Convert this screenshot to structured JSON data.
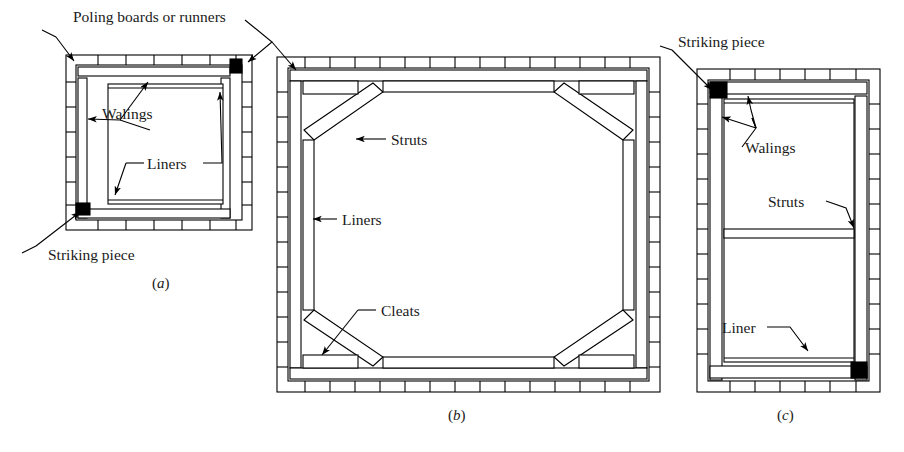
{
  "figure": {
    "background_color": "#ffffff",
    "line_color": "#000000",
    "fill_color": "#ffffff",
    "solid_member_color": "#000000"
  },
  "panels": [
    {
      "id": "a",
      "caption": "(a)",
      "caption_paren_open": "(",
      "caption_letter": "a",
      "caption_paren_close": ")",
      "description": "Square excavation with poling boards, walings and striking pieces",
      "labels": [
        {
          "name": "poling-boards",
          "text": "Poling boards or runners"
        },
        {
          "name": "walings",
          "text": "Walings"
        },
        {
          "name": "liners",
          "text": "Liners"
        },
        {
          "name": "striking-piece",
          "text": "Striking piece"
        }
      ]
    },
    {
      "id": "b",
      "caption": "(b)",
      "caption_paren_open": "(",
      "caption_letter": "b",
      "caption_paren_close": ")",
      "description": "Large excavation with corner raking struts, liners and cleats",
      "labels": [
        {
          "name": "struts",
          "text": "Struts"
        },
        {
          "name": "liners",
          "text": "Liners"
        },
        {
          "name": "cleats",
          "text": "Cleats"
        }
      ]
    },
    {
      "id": "c",
      "caption": "(c)",
      "caption_paren_open": "(",
      "caption_letter": "c",
      "caption_paren_close": ")",
      "description": "Narrow trench with walings, cross struts and liner",
      "labels": [
        {
          "name": "striking-piece",
          "text": "Striking piece"
        },
        {
          "name": "walings",
          "text": "Walings"
        },
        {
          "name": "struts",
          "text": "Struts"
        },
        {
          "name": "liner",
          "text": "Liner"
        }
      ]
    }
  ],
  "text": {
    "poling_boards_or_runners": "Poling boards or runners",
    "walings_a": "Walings",
    "liners_a": "Liners",
    "striking_piece_a": "Striking piece",
    "caption_a_open": "(",
    "caption_a_letter": "a",
    "caption_a_close": ")",
    "struts_b": "Struts",
    "liners_b": "Liners",
    "cleats_b": "Cleats",
    "caption_b_open": "(",
    "caption_b_letter": "b",
    "caption_b_close": ")",
    "striking_piece_c": "Striking piece",
    "walings_c": "Walings",
    "struts_c": "Struts",
    "liner_c": "Liner",
    "caption_c_open": "(",
    "caption_c_letter": "c",
    "caption_c_close": ")"
  }
}
